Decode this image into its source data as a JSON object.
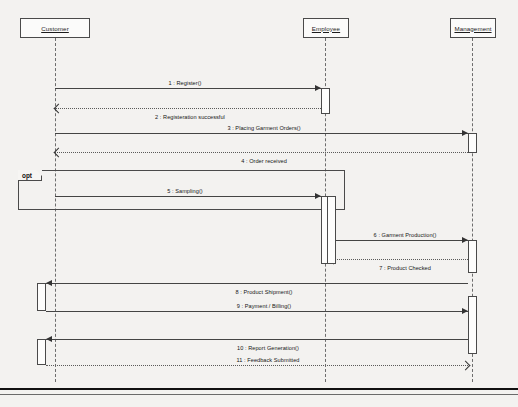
{
  "diagram": {
    "type": "uml-sequence-diagram",
    "width": 518,
    "height": 407,
    "background_color": "#f3f2f0",
    "line_color": "#444444",
    "lifeline_color": "#6d6d6d"
  },
  "lifelines": [
    {
      "id": "customer",
      "label": "Customer",
      "x": 55,
      "box": {
        "x": 20,
        "y": 18,
        "w": 70,
        "h": 20
      },
      "bottom": 382
    },
    {
      "id": "employee",
      "label": "Employee",
      "x": 325,
      "box": {
        "x": 303,
        "y": 18,
        "w": 46,
        "h": 20
      },
      "bottom": 382
    },
    {
      "id": "management",
      "label": "Management",
      "x": 472,
      "box": {
        "x": 450,
        "y": 18,
        "w": 46,
        "h": 20
      },
      "bottom": 382
    }
  ],
  "activations": [
    {
      "lifeline": "employee",
      "x": 321,
      "y": 88,
      "w": 9,
      "h": 26
    },
    {
      "lifeline": "management",
      "x": 468,
      "y": 133,
      "w": 9,
      "h": 20
    },
    {
      "lifeline": "employee",
      "x": 321,
      "y": 196,
      "w": 9,
      "h": 68
    },
    {
      "lifeline": "employee",
      "x": 327,
      "y": 196,
      "w": 9,
      "h": 68
    },
    {
      "lifeline": "management",
      "x": 468,
      "y": 240,
      "w": 9,
      "h": 33
    },
    {
      "lifeline": "customer",
      "x": 37,
      "y": 283,
      "w": 9,
      "h": 28
    },
    {
      "lifeline": "management",
      "x": 468,
      "y": 296,
      "w": 9,
      "h": 58
    },
    {
      "lifeline": "customer",
      "x": 37,
      "y": 339,
      "w": 9,
      "h": 26
    }
  ],
  "fragment": {
    "operator": "opt",
    "x": 18,
    "y": 170,
    "w": 327,
    "h": 40,
    "tab_w": 24,
    "tab_h": 11
  },
  "messages": [
    {
      "seq": "1",
      "label": "1 : Register()",
      "from": "customer",
      "to": "employee",
      "x1": 55,
      "x2": 321,
      "y": 88,
      "kind": "call",
      "direction": "right",
      "label_x": 185,
      "label_y": 80
    },
    {
      "seq": "2",
      "label": "2 : Registeration successful",
      "from": "employee",
      "to": "customer",
      "x1": 55,
      "x2": 321,
      "y": 108,
      "kind": "return",
      "direction": "left",
      "label_x": 190,
      "label_y": 114
    },
    {
      "seq": "3",
      "label": "3 : Placing Garment Orders()",
      "from": "customer",
      "to": "management",
      "x1": 55,
      "x2": 468,
      "y": 133,
      "kind": "call",
      "direction": "right",
      "label_x": 264,
      "label_y": 125
    },
    {
      "seq": "4",
      "label": "4 : Order received",
      "from": "management",
      "to": "customer",
      "x1": 55,
      "x2": 468,
      "y": 152,
      "kind": "return",
      "direction": "left",
      "label_x": 264,
      "label_y": 158
    },
    {
      "seq": "5",
      "label": "5 : Sampling()",
      "from": "customer",
      "to": "employee",
      "x1": 55,
      "x2": 321,
      "y": 196,
      "kind": "call",
      "direction": "right",
      "label_x": 185,
      "label_y": 188
    },
    {
      "seq": "6",
      "label": "6 : Garment Production()",
      "from": "employee",
      "to": "management",
      "x1": 330,
      "x2": 468,
      "y": 240,
      "kind": "call",
      "direction": "right",
      "label_x": 405,
      "label_y": 232
    },
    {
      "seq": "7",
      "label": "7 : Product Checked",
      "from": "management",
      "to": "employee",
      "x1": 330,
      "x2": 468,
      "y": 259,
      "kind": "return",
      "direction": "left",
      "label_x": 405,
      "label_y": 265
    },
    {
      "seq": "8",
      "label": "8 : Product Shipment()",
      "from": "management",
      "to": "customer",
      "x1": 46,
      "x2": 468,
      "y": 283,
      "kind": "call",
      "direction": "left",
      "label_x": 264,
      "label_y": 289
    },
    {
      "seq": "9",
      "label": "9 : Payment / Billing()",
      "from": "customer",
      "to": "management",
      "x1": 46,
      "x2": 468,
      "y": 311,
      "kind": "call",
      "direction": "right",
      "label_x": 264,
      "label_y": 303
    },
    {
      "seq": "10",
      "label": "10 : Report Generation()",
      "from": "management",
      "to": "customer",
      "x1": 46,
      "x2": 468,
      "y": 339,
      "kind": "call",
      "direction": "left",
      "label_x": 268,
      "label_y": 345
    },
    {
      "seq": "11",
      "label": "11 : Feedback Submitted",
      "from": "customer",
      "to": "management",
      "x1": 46,
      "x2": 468,
      "y": 365,
      "kind": "return",
      "direction": "right",
      "label_x": 268,
      "label_y": 357
    }
  ],
  "page_rules": [
    {
      "y": 388,
      "w": 518,
      "weight": "thick"
    },
    {
      "y": 394,
      "w": 518,
      "weight": "thin"
    }
  ]
}
